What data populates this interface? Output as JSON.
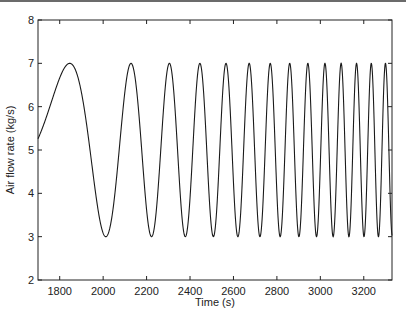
{
  "chart_data": {
    "type": "line",
    "title": "",
    "xlabel": "Time (s)",
    "ylabel": "Air flow rate (kg/s)",
    "xlim": [
      1700,
      3330
    ],
    "ylim": [
      2,
      8
    ],
    "grid": false,
    "legend": null,
    "x_ticks": [
      1800,
      2000,
      2200,
      2400,
      2600,
      2800,
      3000,
      3200
    ],
    "y_ticks": [
      2,
      3,
      4,
      5,
      6,
      7,
      8
    ],
    "series": [
      {
        "name": "Air flow rate",
        "description": "Linear chirp sinusoid: mean 5, amplitude 2, oscillating between 3 and 7 with increasing frequency",
        "model": "y = 5 + 2*sin(0.13 + 0.00564*(t-1700) + 2.895e-5*(t-1700)^2)",
        "peak_times": [
          1846,
          2128,
          2303,
          2446,
          2566,
          2672,
          2769,
          2857,
          2940,
          3018,
          3088,
          3161,
          3235,
          3300
        ],
        "peak_value": 7,
        "trough_times": [
          2012,
          2217,
          2375,
          2507,
          2620,
          2721,
          2814,
          2899,
          2979,
          3054,
          3124,
          3198,
          3268,
          3330
        ],
        "trough_value": 3,
        "start": {
          "t": 1700,
          "y": 5.27
        },
        "end": {
          "t": 3330,
          "y": 3.02
        },
        "color": "#1a1a1a"
      }
    ]
  }
}
